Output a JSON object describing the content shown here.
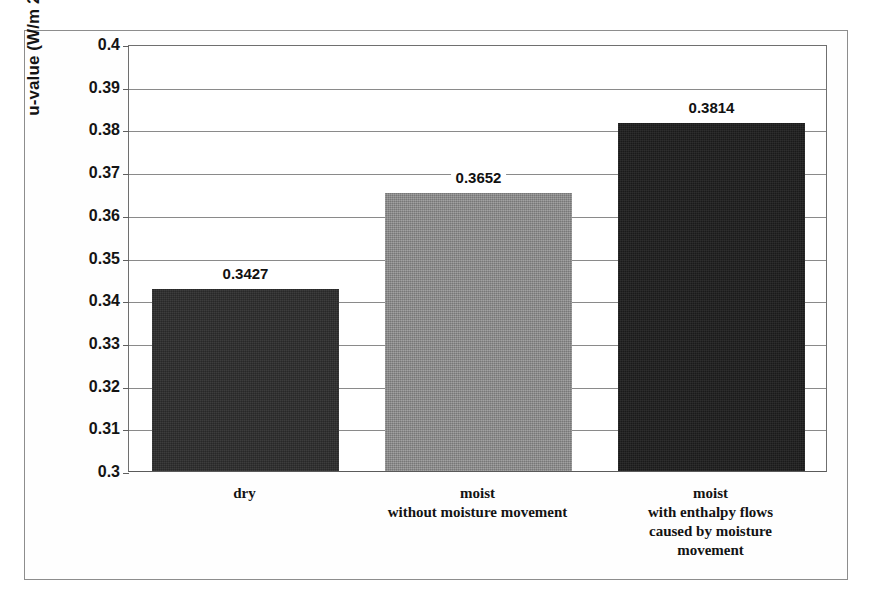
{
  "chart_data": {
    "type": "bar",
    "title": "",
    "xlabel": "",
    "ylabel": "u-value (W/m 2K)",
    "categories": [
      "dry",
      "moist\nwithout moisture movement",
      "moist\nwith enthalpy flows\ncaused by moisture\nmovement"
    ],
    "category_lines": [
      [
        "dry"
      ],
      [
        "moist",
        "without moisture movement"
      ],
      [
        "moist",
        "with enthalpy flows",
        "caused by moisture",
        "movement"
      ]
    ],
    "values": [
      0.3427,
      0.3652,
      0.3814
    ],
    "data_labels": [
      "0.3427",
      "0.3652",
      "0.3814"
    ],
    "ylim": [
      0.3,
      0.4
    ],
    "ytick_step": 0.01,
    "ytick_labels": [
      "0.4",
      "0.39",
      "0.38",
      "0.37",
      "0.36",
      "0.35",
      "0.34",
      "0.33",
      "0.32",
      "0.31",
      "0.3"
    ],
    "ytick_values": [
      0.4,
      0.39,
      0.38,
      0.37,
      0.36,
      0.35,
      0.34,
      0.33,
      0.32,
      0.31,
      0.3
    ],
    "grid": true,
    "legend": false,
    "legend_position": "none",
    "bar_colors": [
      "#2c2c2c",
      "#8c8c8c",
      "#1e1e1e"
    ],
    "frame_color": "#8d8d8d",
    "gridline_color": "#8a8a8a",
    "text_color": "#141414",
    "background": "#ffffff"
  }
}
